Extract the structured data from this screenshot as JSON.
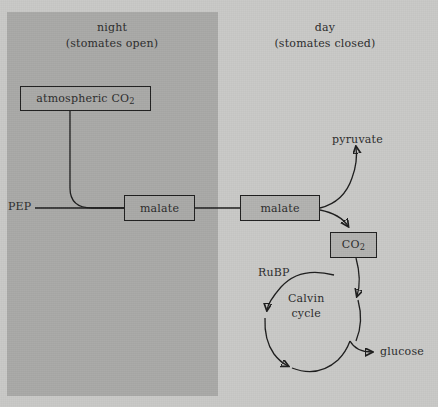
{
  "figure": {
    "type": "biological-pathway-diagram",
    "background_color": "#c9c9c7",
    "night_panel_color": "#a9a9a7",
    "shaded_box_color": "#b2b2b0",
    "stroke_color": "#1c1c1c"
  },
  "regions": {
    "night": {
      "label": "night",
      "sublabel": "(stomates open)"
    },
    "day": {
      "label": "day",
      "sublabel": "(stomates closed)"
    }
  },
  "nodes": {
    "atmospheric_co2": {
      "label_text": "atmospheric CO",
      "subscript": "2",
      "filled": false
    },
    "malate_night": {
      "label": "malate",
      "filled": false
    },
    "malate_day": {
      "label": "malate",
      "filled": true
    },
    "co2_released": {
      "label_text": "CO",
      "subscript": "2",
      "filled": true
    }
  },
  "labels": {
    "pep": "PEP",
    "pyruvate": "pyruvate",
    "rubp": "RuBP",
    "glucose": "glucose",
    "calvin_line1": "Calvin",
    "calvin_line2": "cycle"
  }
}
